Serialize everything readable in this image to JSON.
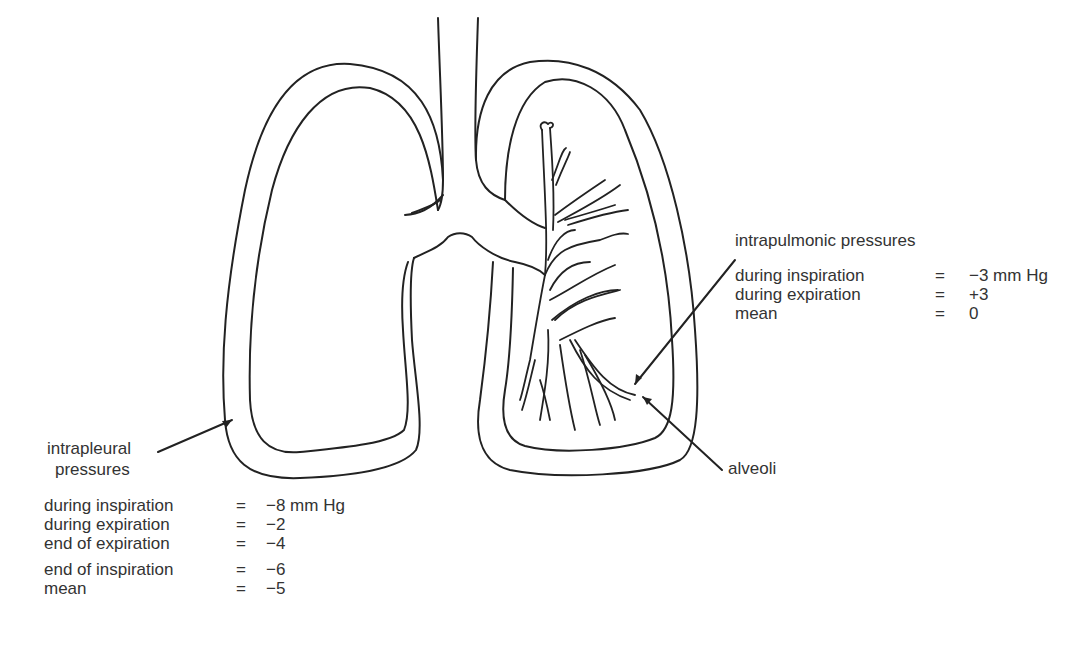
{
  "diagram": {
    "labels": {
      "intrapleural": [
        "intrapleural",
        "pressures"
      ],
      "intrapulmonic": "intrapulmonic pressures",
      "alveoli": "alveoli"
    },
    "intrapulmonic_pressures": [
      {
        "label": "during inspiration",
        "eq": "=",
        "value": "−3 mm Hg"
      },
      {
        "label": "during expiration",
        "eq": "=",
        "value": "+3"
      },
      {
        "label": "mean",
        "eq": "=",
        "value": "0"
      }
    ],
    "intrapleural_pressures": [
      {
        "label": "during inspiration",
        "eq": "=",
        "value": "−8 mm Hg"
      },
      {
        "label": "during expiration",
        "eq": "=",
        "value": "−2"
      },
      {
        "label": "end of expiration",
        "eq": "=",
        "value": "−4"
      },
      {
        "label": "end of inspiration",
        "eq": "=",
        "value": "−6"
      },
      {
        "label": "mean",
        "eq": "=",
        "value": "−5"
      }
    ]
  }
}
